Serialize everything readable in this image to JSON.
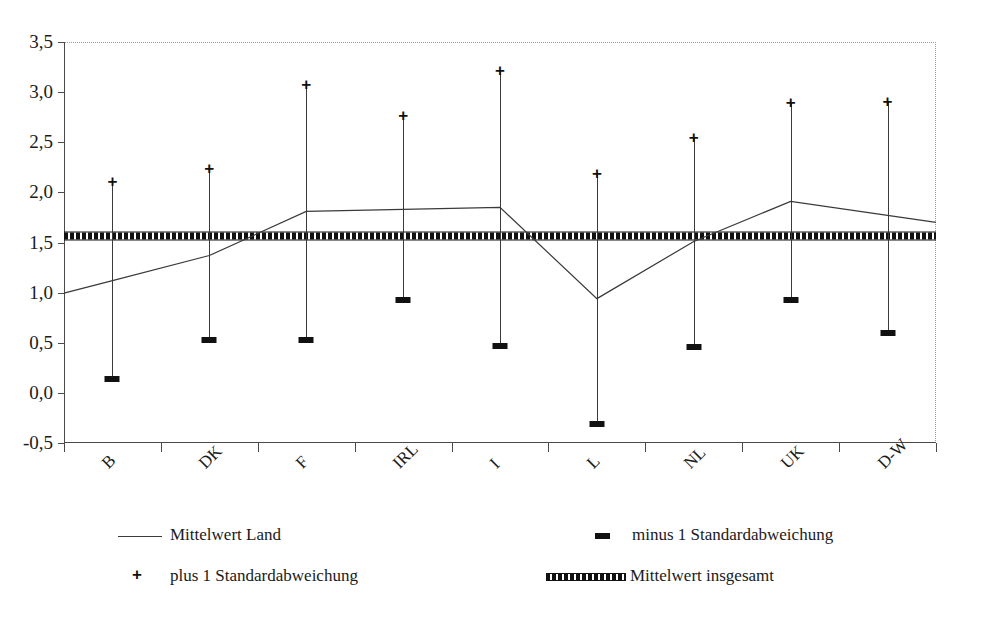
{
  "chart_data": {
    "type": "line",
    "title": "",
    "xlabel": "",
    "ylabel": "",
    "categories": [
      "B",
      "DK",
      "F",
      "IRL",
      "I",
      "L",
      "NL",
      "UK",
      "D-W"
    ],
    "ylim": [
      -0.5,
      3.5
    ],
    "yticks": [
      "-0,5",
      "0,0",
      "0,5",
      "1,0",
      "1,5",
      "2,0",
      "2,5",
      "3,0",
      "3,5"
    ],
    "ytick_values": [
      -0.5,
      0.0,
      0.5,
      1.0,
      1.5,
      2.0,
      2.5,
      3.0,
      3.5
    ],
    "grid": false,
    "legend_position": "bottom",
    "decimal_separator": ",",
    "series": [
      {
        "name": "Mittelwert Land",
        "marker": "line",
        "values": [
          1.12,
          1.37,
          1.81,
          1.83,
          1.85,
          0.94,
          1.51,
          1.91,
          1.77
        ]
      },
      {
        "name": "plus 1 Standardabweichung",
        "marker": "+",
        "values": [
          2.11,
          2.24,
          3.08,
          2.77,
          3.22,
          2.19,
          2.55,
          2.9,
          2.91
        ]
      },
      {
        "name": "minus 1 Standardabweichung",
        "marker": "-",
        "values": [
          0.14,
          0.53,
          0.53,
          0.93,
          0.47,
          -0.31,
          0.46,
          0.93,
          0.6
        ]
      },
      {
        "name": "Mittelwert insgesamt",
        "marker": "band",
        "constant": 1.56
      }
    ]
  },
  "legend": {
    "items": [
      {
        "label": "Mittelwert Land",
        "symbol": "line"
      },
      {
        "label": "minus 1 Standardabweichung",
        "symbol": "minus"
      },
      {
        "label": "plus 1 Standardabweichung",
        "symbol": "plus"
      },
      {
        "label": "Mittelwert insgesamt",
        "symbol": "band"
      }
    ]
  },
  "colors": {
    "line": "#3a3a3a",
    "marker": "#111111",
    "axis": "#4a4a4a",
    "grid": "#999999",
    "background": "#ffffff"
  }
}
